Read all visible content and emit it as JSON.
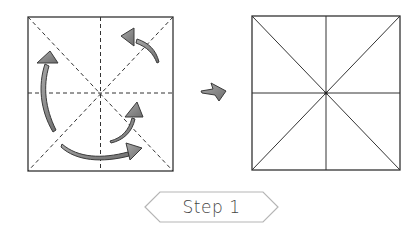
{
  "diagram": {
    "step_label": "Step 1",
    "before": {
      "description": "Square paper with dashed fold lines: vertical, horizontal, two diagonals; curved gray arrows indicating folds",
      "fold_lines": [
        "vertical",
        "horizontal",
        "diagonal-1",
        "diagonal-2"
      ],
      "line_style": "dashed",
      "arrows": [
        "left-upward-arc",
        "top-right-arc",
        "bottom-sweep-arc",
        "center-small-arc"
      ]
    },
    "transition_arrow": "right-arrow",
    "after": {
      "description": "Square paper with solid crease lines: vertical, horizontal, two diagonals",
      "crease_lines": [
        "vertical",
        "horizontal",
        "diagonal-1",
        "diagonal-2"
      ],
      "line_style": "solid"
    },
    "colors": {
      "line": "#333333",
      "arrow_fill": "#8a8a8a",
      "arrow_stroke": "#3a3a3a",
      "label_border": "#b5b5b5"
    }
  }
}
